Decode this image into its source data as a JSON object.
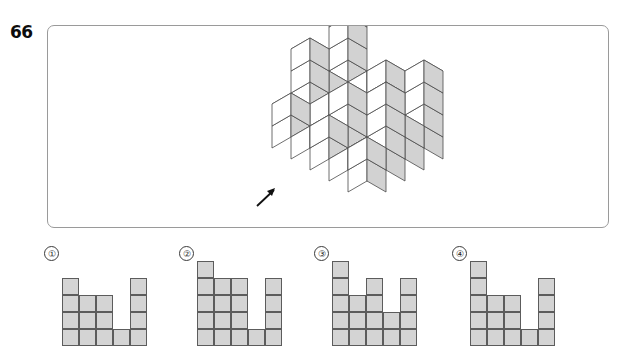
{
  "question": {
    "number": "66"
  },
  "figure": {
    "name": "isometric-cube-stack",
    "arrow": {
      "name": "view-direction-arrow",
      "glyph": "arrow-up-right",
      "points_to": "up-right"
    },
    "colors": {
      "frame_border": "#9a9a9a",
      "cube_outline": "#4a4a4a",
      "cube_top_face": "#ffffff",
      "cube_left_face": "#ffffff",
      "cube_right_face": "#d2d2d2",
      "page_background": "#ffffff"
    },
    "cube_count": 45,
    "cubes": [
      {
        "x": 0,
        "y": 0,
        "z": 0
      },
      {
        "x": 1,
        "y": 0,
        "z": 0
      },
      {
        "x": 2,
        "y": 0,
        "z": 0
      },
      {
        "x": 3,
        "y": 0,
        "z": 0
      },
      {
        "x": 4,
        "y": 0,
        "z": 0
      },
      {
        "x": 0,
        "y": 1,
        "z": 0
      },
      {
        "x": 1,
        "y": 1,
        "z": 0
      },
      {
        "x": 2,
        "y": 1,
        "z": 0
      },
      {
        "x": 3,
        "y": 1,
        "z": 0
      },
      {
        "x": 4,
        "y": 1,
        "z": 0
      },
      {
        "x": 0,
        "y": 2,
        "z": 0
      },
      {
        "x": 1,
        "y": 2,
        "z": 0
      },
      {
        "x": 2,
        "y": 2,
        "z": 0
      },
      {
        "x": 3,
        "y": 2,
        "z": 0
      },
      {
        "x": 4,
        "y": 2,
        "z": 0
      },
      {
        "x": 0,
        "y": 3,
        "z": 0
      },
      {
        "x": 1,
        "y": 3,
        "z": 0
      },
      {
        "x": 2,
        "y": 3,
        "z": 0
      },
      {
        "x": 3,
        "y": 3,
        "z": 0
      },
      {
        "x": 4,
        "y": 3,
        "z": 0
      },
      {
        "x": 0,
        "y": 0,
        "z": 1
      },
      {
        "x": 1,
        "y": 0,
        "z": 1
      },
      {
        "x": 2,
        "y": 0,
        "z": 1
      },
      {
        "x": 4,
        "y": 0,
        "z": 1
      },
      {
        "x": 0,
        "y": 1,
        "z": 1
      },
      {
        "x": 2,
        "y": 1,
        "z": 1
      },
      {
        "x": 4,
        "y": 1,
        "z": 1
      },
      {
        "x": 0,
        "y": 2,
        "z": 1
      },
      {
        "x": 1,
        "y": 2,
        "z": 1
      },
      {
        "x": 2,
        "y": 2,
        "z": 1
      },
      {
        "x": 4,
        "y": 2,
        "z": 1
      },
      {
        "x": 0,
        "y": 3,
        "z": 1
      },
      {
        "x": 2,
        "y": 3,
        "z": 1
      },
      {
        "x": 4,
        "y": 3,
        "z": 1
      },
      {
        "x": 0,
        "y": 0,
        "z": 2
      },
      {
        "x": 2,
        "y": 0,
        "z": 2
      },
      {
        "x": 4,
        "y": 0,
        "z": 2
      },
      {
        "x": 0,
        "y": 2,
        "z": 2
      },
      {
        "x": 2,
        "y": 2,
        "z": 2
      },
      {
        "x": 4,
        "y": 2,
        "z": 2
      },
      {
        "x": 0,
        "y": 0,
        "z": 3
      },
      {
        "x": 4,
        "y": 0,
        "z": 3
      },
      {
        "x": 0,
        "y": 2,
        "z": 3
      },
      {
        "x": 4,
        "y": 2,
        "z": 3
      },
      {
        "x": 0,
        "y": 0,
        "z": 4
      }
    ]
  },
  "options": [
    {
      "label": "①",
      "name": "option-1",
      "columns": 5,
      "rows": 4,
      "filled": [
        [
          1,
          0,
          0,
          0,
          1
        ],
        [
          1,
          1,
          1,
          0,
          1
        ],
        [
          1,
          1,
          1,
          0,
          1
        ],
        [
          1,
          1,
          1,
          1,
          1
        ]
      ]
    },
    {
      "label": "②",
      "name": "option-2",
      "columns": 5,
      "rows": 5,
      "filled": [
        [
          1,
          0,
          0,
          0,
          0
        ],
        [
          1,
          1,
          1,
          0,
          1
        ],
        [
          1,
          1,
          1,
          0,
          1
        ],
        [
          1,
          1,
          1,
          0,
          1
        ],
        [
          1,
          1,
          1,
          1,
          1
        ]
      ]
    },
    {
      "label": "③",
      "name": "option-3",
      "columns": 5,
      "rows": 5,
      "filled": [
        [
          1,
          0,
          0,
          0,
          0
        ],
        [
          1,
          0,
          1,
          0,
          1
        ],
        [
          1,
          1,
          1,
          0,
          1
        ],
        [
          1,
          1,
          1,
          1,
          1
        ],
        [
          1,
          1,
          1,
          1,
          1
        ]
      ]
    },
    {
      "label": "④",
      "name": "option-4",
      "columns": 5,
      "rows": 5,
      "filled": [
        [
          1,
          0,
          0,
          0,
          0
        ],
        [
          1,
          0,
          0,
          0,
          1
        ],
        [
          1,
          1,
          1,
          0,
          1
        ],
        [
          1,
          1,
          1,
          0,
          1
        ],
        [
          1,
          1,
          1,
          1,
          1
        ]
      ]
    }
  ]
}
